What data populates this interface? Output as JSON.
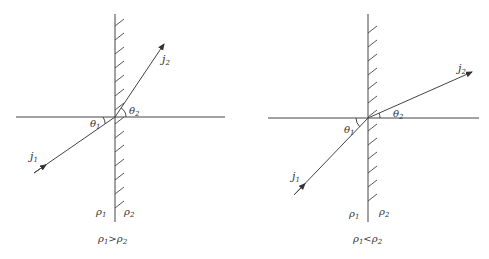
{
  "panels": [
    {
      "id": "left",
      "caption": {
        "a": "ρ",
        "a_sub": "1",
        "op": ">",
        "b": "ρ",
        "b_sub": "2"
      },
      "labels": {
        "j1": "j",
        "j1_sub": "1",
        "j2": "j",
        "j2_sub": "2",
        "theta1": "θ",
        "theta1_sub": "1",
        "theta2": "θ",
        "theta2_sub": "2",
        "rho1": "ρ",
        "rho1_sub": "1",
        "rho2": "ρ",
        "rho2_sub": "2"
      }
    },
    {
      "id": "right",
      "caption": {
        "a": "ρ",
        "a_sub": "1",
        "op": "<",
        "b": "ρ",
        "b_sub": "2"
      },
      "labels": {
        "j1": "j",
        "j1_sub": "1",
        "j2": "j",
        "j2_sub": "2",
        "theta1": "θ",
        "theta1_sub": "1",
        "theta2": "θ",
        "theta2_sub": "2",
        "rho1": "ρ",
        "rho1_sub": "1",
        "rho2": "ρ",
        "rho2_sub": "2"
      }
    }
  ],
  "colors": {
    "line": "#444444",
    "text": "#333333"
  }
}
